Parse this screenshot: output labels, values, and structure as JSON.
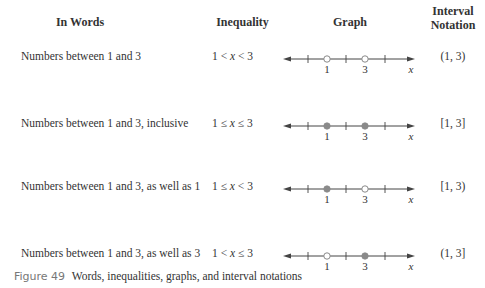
{
  "headers": {
    "words": "In Words",
    "inequality": "Inequality",
    "graph": "Graph",
    "interval_line1": "Interval",
    "interval_line2": "Notation"
  },
  "rows": [
    {
      "words": "Numbers between 1 and 3",
      "ineq_left": "1 <",
      "ineq_var": "x",
      "ineq_right": "< 3",
      "left_point": "open",
      "right_point": "open",
      "label_left": "1",
      "label_right": "3",
      "axis_label": "x",
      "interval": "(1, 3)"
    },
    {
      "words": "Numbers between 1 and 3, inclusive",
      "ineq_left": "1 ≤",
      "ineq_var": "x",
      "ineq_right": "≤ 3",
      "left_point": "closed",
      "right_point": "closed",
      "label_left": "1",
      "label_right": "3",
      "axis_label": "x",
      "interval": "[1, 3]"
    },
    {
      "words": "Numbers between 1 and 3, as well as 1",
      "ineq_left": "1 ≤",
      "ineq_var": "x",
      "ineq_right": "< 3",
      "left_point": "closed",
      "right_point": "open",
      "label_left": "1",
      "label_right": "3",
      "axis_label": "x",
      "interval": "[1, 3)"
    },
    {
      "words": "Numbers between 1 and 3, as well as 3",
      "ineq_left": "1 <",
      "ineq_var": "x",
      "ineq_right": "≤ 3",
      "left_point": "open",
      "right_point": "closed",
      "label_left": "1",
      "label_right": "3",
      "axis_label": "x",
      "interval": "(1, 3]"
    }
  ],
  "caption": {
    "figure_label": "Figure 49",
    "text": "Words, inequalities, graphs, and interval notations"
  },
  "colors": {
    "point_fill": "#8a8a8a",
    "line": "#444444",
    "caption_label": "#777777"
  }
}
